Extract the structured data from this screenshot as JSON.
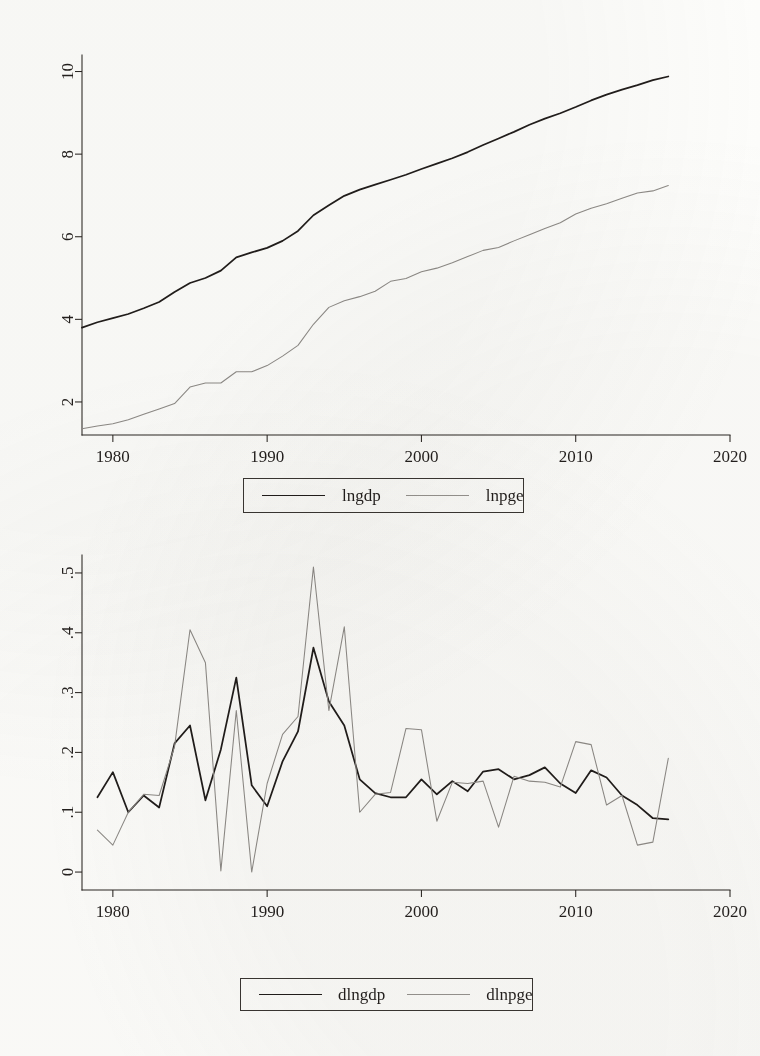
{
  "figure": {
    "background": "#fdfdfb",
    "ink": "#211d1b",
    "gray_ink": "#8e8b87"
  },
  "chart_data": [
    {
      "id": "levels",
      "type": "line",
      "title": "",
      "xlabel": "",
      "ylabel": "",
      "xlim": [
        1978,
        2020
      ],
      "ylim": [
        1.2,
        10.4
      ],
      "xticks": [
        1980,
        1990,
        2000,
        2010,
        2020
      ],
      "xticklabels": [
        "1980",
        "1990",
        "2000",
        "2010",
        "2020"
      ],
      "yticks": [
        2,
        4,
        6,
        8,
        10
      ],
      "yticklabels": [
        "2",
        "4",
        "6",
        "8",
        "10"
      ],
      "grid": false,
      "legend_position": "below",
      "x": [
        1978,
        1979,
        1980,
        1981,
        1982,
        1983,
        1984,
        1985,
        1986,
        1987,
        1988,
        1989,
        1990,
        1991,
        1992,
        1993,
        1994,
        1995,
        1996,
        1997,
        1998,
        1999,
        2000,
        2001,
        2002,
        2003,
        2004,
        2005,
        2006,
        2007,
        2008,
        2009,
        2010,
        2011,
        2012,
        2013,
        2014,
        2015,
        2016
      ],
      "series": [
        {
          "name": "lngdp",
          "color": "#211d1b",
          "style": "solid",
          "values": [
            3.8,
            3.93,
            4.03,
            4.13,
            4.27,
            4.42,
            4.66,
            4.88,
            5.0,
            5.18,
            5.5,
            5.62,
            5.73,
            5.9,
            6.14,
            6.52,
            6.76,
            6.99,
            7.14,
            7.26,
            7.38,
            7.5,
            7.64,
            7.77,
            7.9,
            8.05,
            8.22,
            8.38,
            8.54,
            8.71,
            8.86,
            8.99,
            9.14,
            9.3,
            9.44,
            9.56,
            9.67,
            9.79,
            9.88
          ]
        },
        {
          "name": "lnpge",
          "color": "#8e8b87",
          "style": "solid",
          "values": [
            1.35,
            1.42,
            1.47,
            1.57,
            1.7,
            1.83,
            1.96,
            2.36,
            2.46,
            2.46,
            2.73,
            2.73,
            2.88,
            3.11,
            3.37,
            3.88,
            4.29,
            4.45,
            4.55,
            4.68,
            4.92,
            4.99,
            5.15,
            5.24,
            5.37,
            5.52,
            5.67,
            5.74,
            5.9,
            6.05,
            6.2,
            6.34,
            6.55,
            6.69,
            6.8,
            6.93,
            7.06,
            7.11,
            7.24
          ]
        }
      ],
      "legend": [
        {
          "label": "lngdp",
          "style": "solid",
          "color": "#211d1b"
        },
        {
          "label": "lnpge",
          "style": "solid",
          "color": "#979490"
        }
      ]
    },
    {
      "id": "differences",
      "type": "line",
      "title": "",
      "xlabel": "",
      "ylabel": "",
      "xlim": [
        1978,
        2020
      ],
      "ylim": [
        -0.03,
        0.53
      ],
      "xticks": [
        1980,
        1990,
        2000,
        2010,
        2020
      ],
      "xticklabels": [
        "1980",
        "1990",
        "2000",
        "2010",
        "2020"
      ],
      "yticks": [
        0,
        0.1,
        0.2,
        0.3,
        0.4,
        0.5
      ],
      "yticklabels": [
        "0",
        ".1",
        ".2",
        ".3",
        ".4",
        ".5"
      ],
      "grid": false,
      "legend_position": "below",
      "x": [
        1979,
        1980,
        1981,
        1982,
        1983,
        1984,
        1985,
        1986,
        1987,
        1988,
        1989,
        1990,
        1991,
        1992,
        1993,
        1994,
        1995,
        1996,
        1997,
        1998,
        1999,
        2000,
        2001,
        2002,
        2003,
        2004,
        2005,
        2006,
        2007,
        2008,
        2009,
        2010,
        2011,
        2012,
        2013,
        2014,
        2015,
        2016
      ],
      "series": [
        {
          "name": "dlngdp",
          "color": "#211d1b",
          "style": "solid",
          "values": [
            0.125,
            0.167,
            0.1,
            0.128,
            0.108,
            0.215,
            0.245,
            0.12,
            0.205,
            0.325,
            0.145,
            0.11,
            0.185,
            0.235,
            0.375,
            0.285,
            0.245,
            0.155,
            0.132,
            0.125,
            0.125,
            0.155,
            0.13,
            0.152,
            0.135,
            0.168,
            0.172,
            0.155,
            0.162,
            0.175,
            0.148,
            0.132,
            0.17,
            0.158,
            0.128,
            0.112,
            0.09,
            0.088
          ]
        },
        {
          "name": "dlnpge",
          "color": "#8e8b87",
          "style": "solid",
          "values": [
            0.07,
            0.045,
            0.1,
            0.13,
            0.128,
            0.21,
            0.405,
            0.35,
            0.002,
            0.27,
            0.0,
            0.148,
            0.23,
            0.26,
            0.51,
            0.27,
            0.41,
            0.1,
            0.13,
            0.133,
            0.24,
            0.238,
            0.085,
            0.15,
            0.148,
            0.152,
            0.075,
            0.16,
            0.152,
            0.15,
            0.142,
            0.218,
            0.213,
            0.112,
            0.128,
            0.045,
            0.05,
            0.19,
            0.13
          ]
        }
      ],
      "legend": [
        {
          "label": "dlngdp",
          "style": "solid",
          "color": "#211d1b"
        },
        {
          "label": "dlnpge",
          "style": "solid",
          "color": "#979490"
        }
      ]
    }
  ]
}
